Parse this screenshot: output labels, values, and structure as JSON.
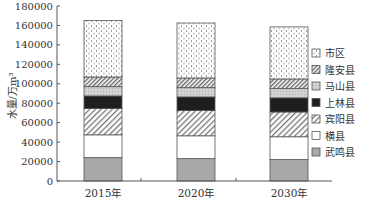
{
  "chart_data": {
    "type": "bar",
    "stacked": true,
    "title": "",
    "xlabel": "",
    "ylabel": "水量/万m³",
    "ylim": [
      0,
      180000
    ],
    "yticks": [
      0,
      20000,
      40000,
      60000,
      80000,
      100000,
      120000,
      140000,
      160000,
      180000
    ],
    "ytick_labels": [
      "0",
      "20000",
      "40000",
      "60000",
      "80000",
      "100000",
      "120000",
      "140000",
      "160000",
      "180000"
    ],
    "categories": [
      "2015年",
      "2020年",
      "2030年"
    ],
    "grid": false,
    "legend_position": "right",
    "series": [
      {
        "name": "武鸣县",
        "pattern": "solid-gray",
        "values": [
          24000,
          23000,
          22000
        ]
      },
      {
        "name": "横县",
        "pattern": "white",
        "values": [
          23500,
          23500,
          23500
        ]
      },
      {
        "name": "宾阳县",
        "pattern": "diagonal-hatch",
        "values": [
          27000,
          26000,
          25500
        ]
      },
      {
        "name": "上林县",
        "pattern": "solid-black",
        "values": [
          13000,
          14000,
          14500
        ]
      },
      {
        "name": "马山县",
        "pattern": "light-gray-dots",
        "values": [
          9500,
          9500,
          9500
        ]
      },
      {
        "name": "隆安县",
        "pattern": "dense-hatch",
        "values": [
          10000,
          10000,
          10000
        ]
      },
      {
        "name": "市区",
        "pattern": "dotted",
        "values": [
          58000,
          56500,
          53500
        ]
      }
    ],
    "totals": [
      165000,
      162500,
      158500
    ]
  },
  "legend": {
    "items": [
      "市区",
      "隆安县",
      "马山县",
      "上林县",
      "宾阳县",
      "横县",
      "武鸣县"
    ]
  },
  "colors": {
    "axis": "#555555",
    "outline": "#555555",
    "wuming": "#a8a8a8",
    "shanglin": "#1e1e1e",
    "mashan": "#c8c8c8",
    "hatch": "#777777",
    "dots": "#999999"
  }
}
